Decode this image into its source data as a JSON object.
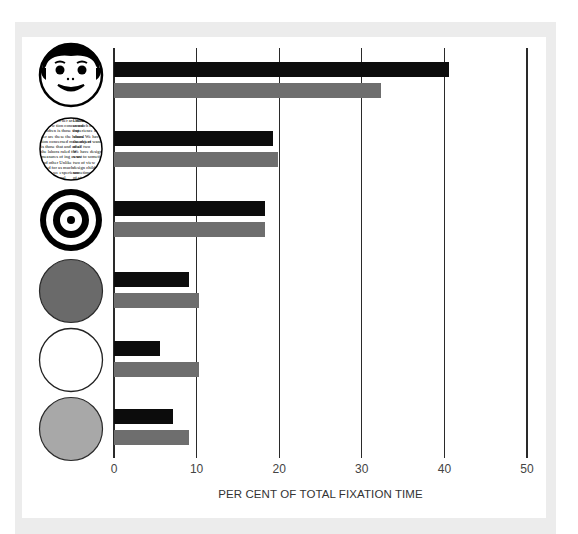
{
  "chart_data": {
    "type": "bar",
    "orientation": "horizontal",
    "title": "",
    "xlabel": "PER CENT OF TOTAL FIXATION TIME",
    "ylabel": "",
    "xlim": [
      0,
      50
    ],
    "x_ticks": [
      0,
      10,
      20,
      30,
      40,
      50
    ],
    "grid": "vertical lines at each tick",
    "legend": "none",
    "categories": [
      "face",
      "printed text",
      "bull's-eye",
      "dark grey disk",
      "white disk",
      "light grey disk"
    ],
    "category_icons": [
      "face-icon",
      "newsprint-icon",
      "bullseye-icon",
      "dark-disk-icon",
      "white-disk-icon",
      "light-disk-icon"
    ],
    "series": [
      {
        "name": "black bars",
        "color": "#0c0c0c",
        "values": [
          40.6,
          19.2,
          18.3,
          9.1,
          5.6,
          7.1
        ]
      },
      {
        "name": "grey bars",
        "color": "#6e6e6e",
        "values": [
          32.3,
          19.9,
          18.3,
          10.3,
          10.3,
          9.1
        ]
      }
    ]
  },
  "axis": {
    "ticks": [
      "0",
      "10",
      "20",
      "30",
      "40",
      "50"
    ],
    "label": "PER CENT OF TOTAL FIXATION TIME"
  },
  "newsprint_text": [
    "sometimes",
    "of view",
    "children",
    "ber are these",
    "tion concerned",
    "is those that",
    "the labora",
    "measures of",
    "and other",
    "ruled for",
    "ing as we",
    "Unlike",
    "as much",
    "experience",
    "visual",
    "the object",
    "at all",
    "We have",
    "want to",
    "two",
    "design"
  ]
}
